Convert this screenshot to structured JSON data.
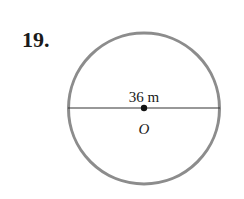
{
  "problem": {
    "number": "19."
  },
  "figure": {
    "shape": "circle",
    "diameter_label": "36 m",
    "center_label": "O",
    "colors": {
      "circle_stroke": "#8c8c8c",
      "diameter_line": "#333333",
      "center_dot": "#111111",
      "text": "#1a1a1a"
    }
  }
}
